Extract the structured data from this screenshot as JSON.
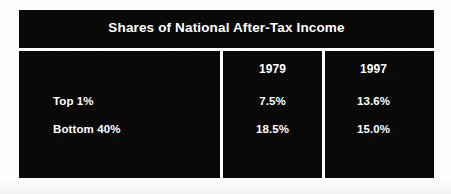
{
  "figure": {
    "title": "Shares of National After-Tax Income",
    "colors": {
      "panel": "#080808",
      "text": "#ffffff",
      "page_background": "#fdfdfd",
      "divider": "#ffffff"
    }
  },
  "chart_data": {
    "type": "table",
    "title": "Shares of National After-Tax Income",
    "xlabel": "",
    "ylabel": "",
    "columns": [
      "",
      "1979",
      "1997"
    ],
    "categories": [
      "Top 1%",
      "Bottom 40%"
    ],
    "series": [
      {
        "name": "1979",
        "values": [
          7.5,
          18.5
        ]
      },
      {
        "name": "1997",
        "values": [
          13.6,
          15.0
        ]
      }
    ],
    "rows": [
      {
        "label": "Top 1%",
        "v1979": "7.5%",
        "v1997": "13.6%"
      },
      {
        "label": "Bottom 40%",
        "v1979": "18.5%",
        "v1997": "15.0%"
      }
    ],
    "units": "percent",
    "grid": false,
    "legend": "none"
  }
}
